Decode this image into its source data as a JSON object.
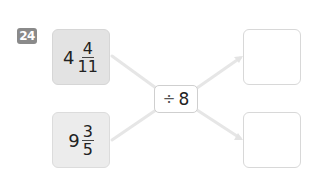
{
  "problem": {
    "number": "24",
    "badge_color": "#8a8a8a"
  },
  "inputs": [
    {
      "whole": "4",
      "numerator": "4",
      "denominator": "11"
    },
    {
      "whole": "9",
      "numerator": "3",
      "denominator": "5"
    }
  ],
  "operator": {
    "symbol": "÷",
    "operand": "8"
  },
  "outputs": [
    {
      "value": ""
    },
    {
      "value": ""
    }
  ]
}
